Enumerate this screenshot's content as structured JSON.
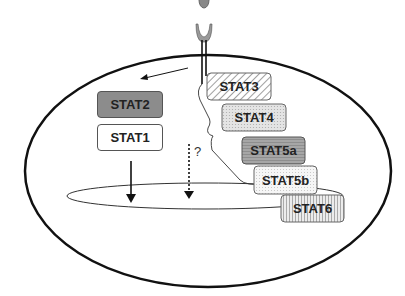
{
  "diagram": {
    "receptor": {
      "label": ""
    },
    "stats": [
      {
        "label": "STAT2",
        "fill": "#8c8c8c",
        "pattern": "solid"
      },
      {
        "label": "STAT1",
        "fill": "#ffffff",
        "pattern": "solid"
      },
      {
        "label": "STAT3",
        "fill": "#ffffff",
        "pattern": "diagonal-hatch"
      },
      {
        "label": "STAT4",
        "fill": "#dcdcdc",
        "pattern": "dots"
      },
      {
        "label": "STAT5a",
        "fill": "#a0a0a0",
        "pattern": "horizontal-lines"
      },
      {
        "label": "STAT5b",
        "fill": "#f2f2f2",
        "pattern": "dots"
      },
      {
        "label": "STAT6",
        "fill": "#e0e0e0",
        "pattern": "vertical-lines"
      }
    ],
    "unknown_marker": "?"
  }
}
